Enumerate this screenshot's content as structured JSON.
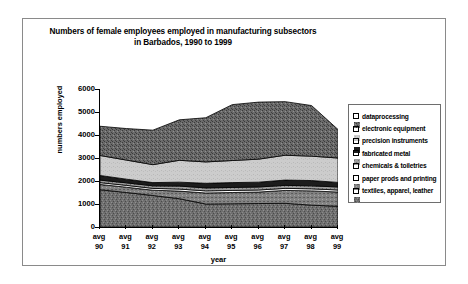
{
  "chart_data": {
    "type": "area",
    "title": "Numbers of female employees employed in manufacturing subsectors",
    "subtitle": "in Barbados, 1990 to 1999",
    "xlabel": "year",
    "ylabel": "numbers employed",
    "ylim": [
      0,
      6000
    ],
    "ytick_labels": [
      "6000",
      "5000",
      "4000",
      "3000",
      "2000",
      "1000",
      "0"
    ],
    "ytick_values": [
      6000,
      5000,
      4000,
      3000,
      2000,
      1000,
      0
    ],
    "grid": false,
    "stacked": true,
    "legend_position": "right",
    "categories": [
      "avg 90",
      "avg 91",
      "avg 92",
      "avg 93",
      "avg 94",
      "avg 95",
      "avg 96",
      "avg 97",
      "avg 98",
      "avg 99"
    ],
    "category_lines": [
      [
        "avg",
        "90"
      ],
      [
        "avg",
        "91"
      ],
      [
        "avg",
        "92"
      ],
      [
        "avg",
        "93"
      ],
      [
        "avg",
        "94"
      ],
      [
        "avg",
        "95"
      ],
      [
        "avg",
        "96"
      ],
      [
        "avg",
        "97"
      ],
      [
        "avg",
        "98"
      ],
      [
        "avg",
        "99"
      ]
    ],
    "series": [
      {
        "name": "textiles, apparel, leather",
        "pattern": "dense-speckle-dark",
        "color": "#6b6b6b",
        "values": [
          1620,
          1500,
          1370,
          1230,
          1000,
          1010,
          1020,
          1030,
          950,
          900
        ]
      },
      {
        "name": "paper prods and printing",
        "pattern": "medium-speckle",
        "color": "#808080",
        "values": [
          230,
          230,
          230,
          330,
          480,
          490,
          500,
          560,
          620,
          620
        ]
      },
      {
        "name": "chemicals & toiletries",
        "pattern": "solid-white",
        "color": "#ffffff",
        "values": [
          80,
          80,
          80,
          90,
          90,
          90,
          90,
          90,
          90,
          90
        ]
      },
      {
        "name": "fabricated metal",
        "pattern": "fine-speckle",
        "color": "#9a9a9a",
        "values": [
          110,
          110,
          110,
          130,
          130,
          130,
          130,
          130,
          130,
          130
        ]
      },
      {
        "name": "precision instruments",
        "pattern": "solid-black",
        "color": "#1a1a1a",
        "values": [
          200,
          160,
          140,
          170,
          200,
          210,
          210,
          230,
          230,
          200
        ]
      },
      {
        "name": "electronic equipment",
        "pattern": "light-grey",
        "color": "#c9c9c9",
        "values": [
          870,
          830,
          780,
          950,
          930,
          960,
          1000,
          1080,
          1060,
          1060
        ]
      },
      {
        "name": "dataprocessing",
        "pattern": "dark-speckle",
        "color": "#5f5f5f",
        "values": [
          1270,
          1370,
          1500,
          1760,
          1920,
          2430,
          2480,
          2330,
          2200,
          1240
        ]
      }
    ],
    "stack_totals": [
      4380,
      4280,
      4210,
      4660,
      4750,
      5320,
      5430,
      5450,
      5240,
      4240
    ]
  },
  "legend": {
    "items": [
      {
        "label": "dataprocessing",
        "swatch": "dark-speckle"
      },
      {
        "label": "electronic equipment",
        "swatch": "light-grey"
      },
      {
        "label": "precision instruments",
        "swatch": "solid-black"
      },
      {
        "label": "fabricated metal",
        "swatch": "fine-speckle"
      },
      {
        "label": "chemicals & toiletries",
        "swatch": "solid-white"
      },
      {
        "label": "paper prods and printing",
        "swatch": "medium-speckle"
      },
      {
        "label": "textiles, apparel, leather",
        "swatch": "dense-speckle-dark"
      }
    ]
  },
  "colors": {
    "frame_border": "#8a8a8a",
    "axis": "#000000",
    "legend_border": "#6e6e6e",
    "background": "#ffffff"
  }
}
